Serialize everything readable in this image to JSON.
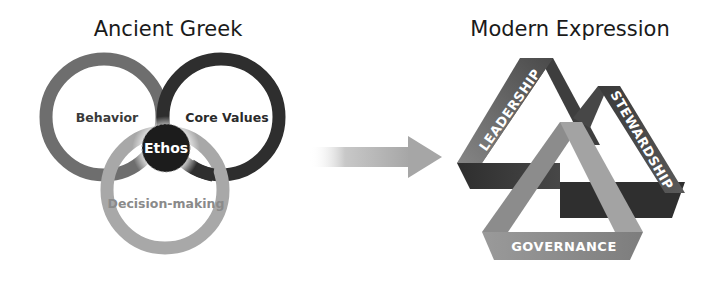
{
  "left_panel": {
    "title": "Ancient Greek",
    "center_label": "Ethos",
    "rings": [
      {
        "label": "Behavior",
        "color": "#6e6e6e"
      },
      {
        "label": "Core Values",
        "color": "#2e2e2e"
      },
      {
        "label": "Decision-making",
        "color": "#a8a8a8"
      }
    ],
    "center_color": "#1c1c1c"
  },
  "arrow": {
    "direction": "right",
    "color": "#a9a9a9"
  },
  "right_panel": {
    "title": "Modern Expression",
    "bands": [
      {
        "label": "LEADERSHIP",
        "color": "#6a6a6a"
      },
      {
        "label": "STEWARDSHIP",
        "color": "#3a3a3a"
      },
      {
        "label": "GOVERNANCE",
        "color": "#9a9a9a"
      }
    ]
  }
}
